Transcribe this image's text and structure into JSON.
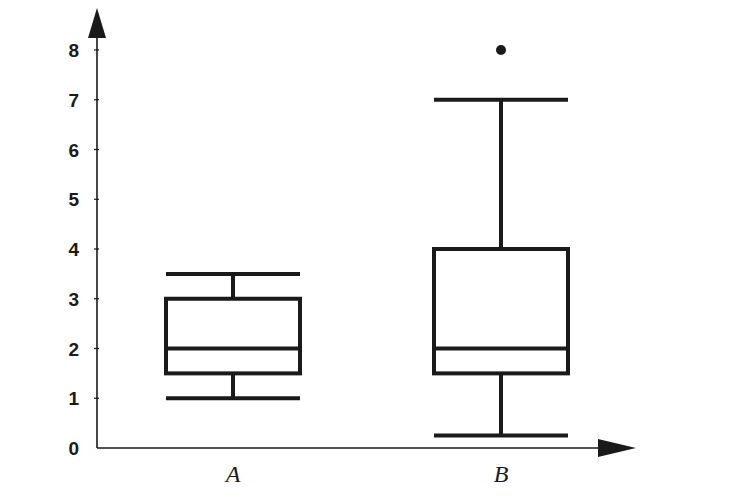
{
  "chart_data": {
    "type": "box",
    "title": "",
    "xlabel": "",
    "ylabel": "",
    "ylim": [
      0,
      8
    ],
    "grid": false,
    "legend": "none",
    "yticks": [
      "0",
      "1",
      "2",
      "3",
      "4",
      "5",
      "6",
      "7",
      "8"
    ],
    "categories": [
      "A",
      "B"
    ],
    "series": [
      {
        "name": "A",
        "whisker_low": 1,
        "q1": 1.5,
        "median": 2,
        "q3": 3,
        "whisker_high": 3.5,
        "outliers": []
      },
      {
        "name": "B",
        "whisker_low": 0.25,
        "q1": 1.5,
        "median": 2,
        "q3": 4,
        "whisker_high": 7,
        "outliers": [
          8
        ]
      }
    ],
    "colors": {
      "ink": "#1a1a1a",
      "background": "#ffffff"
    }
  }
}
